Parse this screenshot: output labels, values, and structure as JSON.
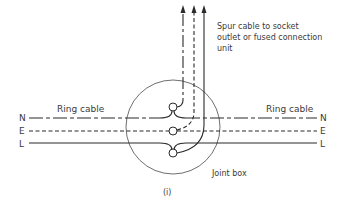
{
  "diagram": {
    "type": "wiring-diagram",
    "labels": {
      "spur_line1": "Spur cable to socket",
      "spur_line2": "outlet or fused connection",
      "spur_line3": "unit",
      "ring_left": "Ring cable",
      "ring_right": "Ring cable",
      "joint_box": "Joint box",
      "caption": "(i)"
    },
    "conductors": [
      {
        "id": "N",
        "name": "Neutral",
        "left_label": "N",
        "right_label": "N",
        "style": "dash-dot"
      },
      {
        "id": "E",
        "name": "Earth",
        "left_label": "E",
        "right_label": "E",
        "style": "dashed"
      },
      {
        "id": "L",
        "name": "Line",
        "left_label": "L",
        "right_label": "L",
        "style": "solid"
      }
    ],
    "terminals": [
      "N",
      "E",
      "L"
    ],
    "spur_arrows": 3,
    "colors": {
      "line": "#2b2b2b",
      "text": "#3a3a3a",
      "background": "#ffffff"
    }
  }
}
